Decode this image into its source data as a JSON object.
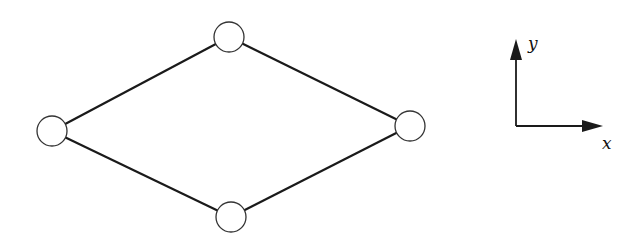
{
  "diagram": {
    "type": "graph",
    "colors": {
      "stroke": "#1a1a1a",
      "node_fill": "#ffffff",
      "background": "#ffffff"
    },
    "nodes": [
      {
        "id": "top",
        "cx": 229,
        "cy": 37,
        "r": 15
      },
      {
        "id": "left",
        "cx": 52,
        "cy": 131,
        "r": 15
      },
      {
        "id": "right",
        "cx": 410,
        "cy": 126,
        "r": 15
      },
      {
        "id": "bottom",
        "cx": 231,
        "cy": 217,
        "r": 15
      }
    ],
    "edges": [
      {
        "from": "left",
        "to": "top"
      },
      {
        "from": "top",
        "to": "right"
      },
      {
        "from": "right",
        "to": "bottom"
      },
      {
        "from": "bottom",
        "to": "left"
      }
    ],
    "axes": {
      "x_label": "x",
      "y_label": "y"
    }
  }
}
